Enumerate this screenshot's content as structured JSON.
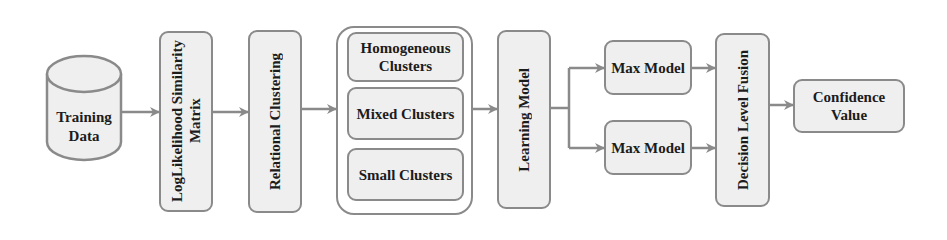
{
  "diagram": {
    "nodes": {
      "training_data": {
        "label_line1": "Training",
        "label_line2": "Data",
        "shape": "cylinder"
      },
      "loglikelihood": {
        "label_line1": "LogLikelihood Similarity",
        "label_line2": "Matrix"
      },
      "relational_clustering": {
        "label": "Relational Clustering"
      },
      "clusters": {
        "homogeneous": {
          "label_line1": "Homogeneous",
          "label_line2": "Clusters"
        },
        "mixed": {
          "label": "Mixed Clusters"
        },
        "small": {
          "label": "Small Clusters"
        }
      },
      "learning_model": {
        "label": "Learning Model"
      },
      "max_model_top": {
        "label": "Max Model"
      },
      "max_model_bottom": {
        "label": "Max Model"
      },
      "decision_fusion": {
        "label": "Decision Level Fusion"
      },
      "confidence_value": {
        "label_line1": "Confidence",
        "label_line2": "Value"
      }
    },
    "edges": [
      {
        "from": "training_data",
        "to": "loglikelihood"
      },
      {
        "from": "loglikelihood",
        "to": "relational_clustering"
      },
      {
        "from": "relational_clustering",
        "to": "clusters"
      },
      {
        "from": "clusters",
        "to": "learning_model"
      },
      {
        "from": "learning_model",
        "to": "max_model_top"
      },
      {
        "from": "learning_model",
        "to": "max_model_bottom"
      },
      {
        "from": "max_model_top",
        "to": "decision_fusion"
      },
      {
        "from": "max_model_bottom",
        "to": "decision_fusion"
      },
      {
        "from": "decision_fusion",
        "to": "confidence_value"
      }
    ],
    "colors": {
      "stroke": "#8a8a8a",
      "fill": "#efefef",
      "text": "#1c1c1c"
    }
  }
}
